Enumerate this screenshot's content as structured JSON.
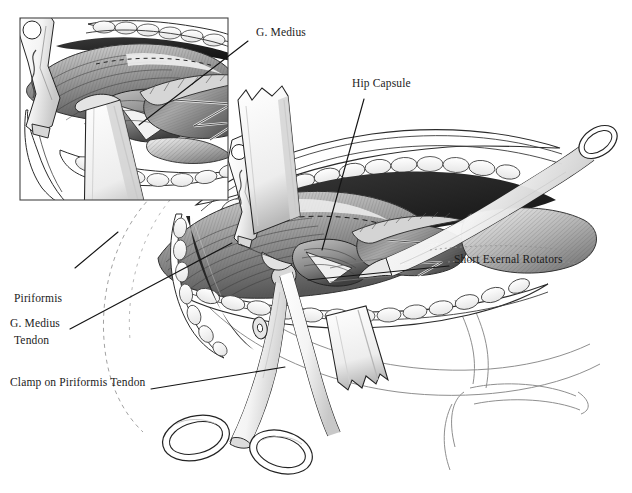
{
  "figure": {
    "style": "grayscale pen-and-ink medical illustration",
    "width": 632,
    "height": 493,
    "background_color": "#ffffff",
    "ink_color": "#1b1b1b"
  },
  "labels": [
    {
      "id": "g-medius-inset",
      "text": "G. Medius",
      "x": 256,
      "y": 33,
      "leader_from": [
        248,
        41
      ],
      "leader_to": [
        139,
        125
      ]
    },
    {
      "id": "hip-capsule",
      "text": "Hip Capsule",
      "x": 352,
      "y": 84,
      "leader_from": [
        364,
        99
      ],
      "leader_to": [
        322,
        250
      ]
    },
    {
      "id": "short-external-rotators",
      "text": "Short Exernal Rotators",
      "x": 454,
      "y": 260,
      "leader_from": [
        449,
        266
      ],
      "leader_to": [
        308,
        280
      ]
    },
    {
      "id": "piriformis-tendon",
      "line1": "Piriformis",
      "line2": "Tendon",
      "x": 14,
      "y": 270,
      "leader_from": [
        75,
        268
      ],
      "leader_to": [
        118,
        232
      ]
    },
    {
      "id": "g-medius-main",
      "text": "G. Medius",
      "x": 10,
      "y": 324,
      "leader_from": [
        70,
        329
      ],
      "leader_to": [
        232,
        243
      ]
    },
    {
      "id": "clamp-on-piriformis-tendon",
      "text": "Clamp on Piriformis Tendon",
      "x": 10,
      "y": 383,
      "leader_from": [
        151,
        389
      ],
      "leader_to": [
        285,
        367
      ]
    }
  ],
  "inset": {
    "id": "magnified-inset",
    "description": "Magnified view of gluteus medius and piriformis tendon",
    "frame": {
      "x": 20,
      "y": 18,
      "width": 208,
      "height": 182
    },
    "border_color": "#444444"
  },
  "instruments": [
    {
      "id": "hohmann-retractor-inset",
      "name": "Hohmann retractor",
      "region": "inset upper left"
    },
    {
      "id": "retractor-blade-upper",
      "name": "Ribbon retractor blade",
      "region": "main upper left"
    },
    {
      "id": "retractor-blade-lower",
      "name": "Ribbon retractor blade",
      "region": "main lower center"
    },
    {
      "id": "hohmann-retractor-main",
      "name": "Hohmann retractor",
      "region": "main left"
    },
    {
      "id": "long-retractor-right",
      "name": "Long ring-handled retractor",
      "region": "main right"
    },
    {
      "id": "hemostat-clamp",
      "name": "Curved hemostat clamp",
      "region": "bottom center"
    }
  ],
  "anatomy": [
    {
      "id": "gluteus-medius",
      "name": "Gluteus medius muscle"
    },
    {
      "id": "hip-capsule",
      "name": "Hip joint capsule"
    },
    {
      "id": "short-external-rotators",
      "name": "Short external rotators"
    },
    {
      "id": "piriformis-tendon",
      "name": "Piriformis tendon"
    },
    {
      "id": "subcutaneous-fat",
      "name": "Subcutaneous fat layer"
    },
    {
      "id": "skin-margin",
      "name": "Skin incision margin"
    },
    {
      "id": "thigh-contour",
      "name": "Thigh and leg outline"
    }
  ],
  "colors": {
    "ink": "#1b1b1b",
    "text": "#1b1b1b",
    "muscle_dark": "#4a4a4a",
    "muscle_mid": "#8d8d8d",
    "muscle_light": "#c9c9c9",
    "metal_light": "#fbfbfb",
    "metal_shadow": "#9a9a9a",
    "fat": "#f2f2f2",
    "outline_faint": "#8a8a8a",
    "background": "#ffffff"
  }
}
